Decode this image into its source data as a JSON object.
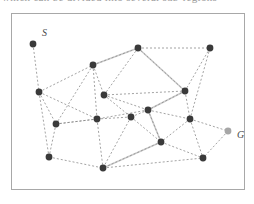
{
  "figure": {
    "title_sliver": "which can be divided into several sub-regions",
    "background_color": "#ffffff",
    "frame": {
      "x": 11,
      "y": 13,
      "width": 233,
      "height": 176,
      "color": "#a8a8a8"
    },
    "node_color": "#3a3a3a",
    "goal_node_color": "#a6a6a6",
    "edge_color": "#8c8c8c",
    "path_color": "#cccccc",
    "label_color": "#4a4a4a"
  },
  "graph": {
    "start_label": "S",
    "goal_label": "G",
    "node_count": 17,
    "nodes": [
      {
        "id": "S",
        "x": 33,
        "y": 44,
        "kind": "start"
      },
      {
        "id": "n1",
        "x": 138,
        "y": 48,
        "kind": "normal"
      },
      {
        "id": "n2",
        "x": 210,
        "y": 48,
        "kind": "normal"
      },
      {
        "id": "n3",
        "x": 93,
        "y": 65,
        "kind": "normal"
      },
      {
        "id": "n4",
        "x": 39,
        "y": 92,
        "kind": "normal"
      },
      {
        "id": "n5",
        "x": 104,
        "y": 95,
        "kind": "normal"
      },
      {
        "id": "n6",
        "x": 185,
        "y": 91,
        "kind": "normal"
      },
      {
        "id": "n7",
        "x": 148,
        "y": 110,
        "kind": "normal"
      },
      {
        "id": "n8",
        "x": 97,
        "y": 119,
        "kind": "normal"
      },
      {
        "id": "n9",
        "x": 131,
        "y": 117,
        "kind": "normal"
      },
      {
        "id": "n10",
        "x": 190,
        "y": 119,
        "kind": "normal"
      },
      {
        "id": "n11",
        "x": 56,
        "y": 124,
        "kind": "normal"
      },
      {
        "id": "n12",
        "x": 161,
        "y": 142,
        "kind": "normal"
      },
      {
        "id": "n13",
        "x": 49,
        "y": 157,
        "kind": "normal"
      },
      {
        "id": "n14",
        "x": 103,
        "y": 168,
        "kind": "normal"
      },
      {
        "id": "n15",
        "x": 203,
        "y": 158,
        "kind": "normal"
      },
      {
        "id": "G",
        "x": 228,
        "y": 131,
        "kind": "goal"
      }
    ],
    "edges": [
      [
        "S",
        "n4"
      ],
      [
        "n4",
        "n3"
      ],
      [
        "n4",
        "n11"
      ],
      [
        "n4",
        "n8"
      ],
      [
        "n4",
        "n13"
      ],
      [
        "n3",
        "n1"
      ],
      [
        "n3",
        "n5"
      ],
      [
        "n3",
        "n8"
      ],
      [
        "n3",
        "n11"
      ],
      [
        "n1",
        "n2"
      ],
      [
        "n1",
        "n5"
      ],
      [
        "n1",
        "n6"
      ],
      [
        "n2",
        "n6"
      ],
      [
        "n2",
        "n10"
      ],
      [
        "n5",
        "n7"
      ],
      [
        "n5",
        "n9"
      ],
      [
        "n5",
        "n6"
      ],
      [
        "n6",
        "n7"
      ],
      [
        "n6",
        "n10"
      ],
      [
        "n7",
        "n9"
      ],
      [
        "n7",
        "n10"
      ],
      [
        "n7",
        "n12"
      ],
      [
        "n7",
        "n8"
      ],
      [
        "n8",
        "n9"
      ],
      [
        "n8",
        "n11"
      ],
      [
        "n8",
        "n14"
      ],
      [
        "n9",
        "n14"
      ],
      [
        "n9",
        "n12"
      ],
      [
        "n10",
        "n12"
      ],
      [
        "n10",
        "G"
      ],
      [
        "n10",
        "n15"
      ],
      [
        "n11",
        "n13"
      ],
      [
        "n11",
        "n8"
      ],
      [
        "n12",
        "n14"
      ],
      [
        "n12",
        "n15"
      ],
      [
        "n13",
        "n14"
      ],
      [
        "n14",
        "n15"
      ],
      [
        "G",
        "n15"
      ]
    ],
    "solution_path": [
      "n3",
      "n1",
      "n6",
      "n7",
      "n12",
      "n14"
    ]
  }
}
